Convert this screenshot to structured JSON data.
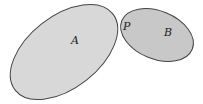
{
  "diagram": {
    "regions": [
      {
        "id": "A",
        "label": "A",
        "fill": "#d8d8d8",
        "stroke": "#444444"
      },
      {
        "id": "B",
        "label": "B",
        "fill": "#c8c8c8",
        "stroke": "#444444"
      }
    ],
    "point": {
      "label": "P",
      "description": "point of contact between A and B"
    }
  }
}
